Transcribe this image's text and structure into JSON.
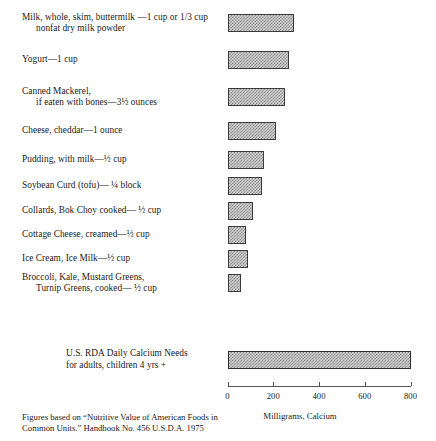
{
  "figure": {
    "axis_title": "Milligrams,  Calcium",
    "source_note_line1": "Figures based on “Nutritive Value of American Foods in",
    "source_note_line2": "Common Units.” Handbook No. 456 U.S.D.A. 1975",
    "bar_fill_color": "#cfcfcf",
    "bar_border_color": "#3b3b3b",
    "background_color": "#ffffff"
  },
  "axis": {
    "ticks": [
      {
        "value": 0,
        "label": "0"
      },
      {
        "value": 200,
        "label": "200"
      },
      {
        "value": 400,
        "label": "400"
      },
      {
        "value": 600,
        "label": "600"
      },
      {
        "value": 800,
        "label": "800"
      }
    ],
    "min": 0,
    "max": 800
  },
  "rows": [
    {
      "line1": "Milk, whole, skim, buttermilk —1 cup or 1/3 cup",
      "line2": "nonfat dry milk powder",
      "value": 290
    },
    {
      "line1": "Yogurt—1 cup",
      "line2": "",
      "value": 270
    },
    {
      "line1": "Canned Mackerel,",
      "line2": "if eaten with bones—3½ ounces",
      "value": 250
    },
    {
      "line1": "Cheese, cheddar—1 ounce",
      "line2": "",
      "value": 210
    },
    {
      "line1": "Pudding, with milk—½ cup",
      "line2": "",
      "value": 160
    },
    {
      "line1": "Soybean Curd (tofu)— ¼ block",
      "line2": "",
      "value": 150
    },
    {
      "line1": "Collards, Bok Choy cooked— ½ cup",
      "line2": "",
      "value": 110
    },
    {
      "line1": "Cottage Cheese, creamed—½ cup",
      "line2": "",
      "value": 80
    },
    {
      "line1": "Ice Cream, Ice Milk—½ cup",
      "line2": "",
      "value": 90
    },
    {
      "line1": "Broccoli, Kale, Mustard Greens,",
      "line2": "Turnip Greens, cooked— ½ cup",
      "value": 60
    }
  ],
  "rda": {
    "line1": "U.S. RDA Daily Calcium Needs",
    "line2": "for adults, children 4 yrs +",
    "value": 800
  },
  "chart_data": {
    "type": "bar",
    "orientation": "horizontal",
    "title": "",
    "xlabel": "Milligrams,  Calcium",
    "ylabel": "",
    "xlim": [
      0,
      800
    ],
    "xticks": [
      0,
      200,
      400,
      600,
      800
    ],
    "grid": false,
    "legend": null,
    "categories": [
      "Milk, whole, skim, buttermilk —1 cup or 1/3 cup nonfat dry milk powder",
      "Yogurt—1 cup",
      "Canned Mackerel, if eaten with bones—3½ ounces",
      "Cheese, cheddar—1 ounce",
      "Pudding, with milk—½ cup",
      "Soybean Curd (tofu)— ¼ block",
      "Collards, Bok Choy cooked— ½ cup",
      "Cottage Cheese, creamed—½ cup",
      "Ice Cream, Ice Milk—½ cup",
      "Broccoli, Kale, Mustard Greens, Turnip Greens, cooked— ½ cup",
      "U.S. RDA Daily Calcium Needs for adults, children 4 yrs +"
    ],
    "values": [
      290,
      270,
      250,
      210,
      160,
      150,
      110,
      80,
      90,
      60,
      800
    ],
    "units": "milligrams",
    "annotations": [
      "Figures based on “Nutritive Value of American Foods in Common Units.” Handbook No. 456 U.S.D.A. 1975"
    ]
  }
}
